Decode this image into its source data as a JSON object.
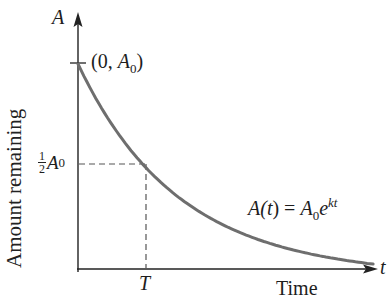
{
  "chart_data": {
    "type": "line",
    "title": "",
    "xlabel": "Time",
    "ylabel": "Amount remaining",
    "x_axis_symbol": "t",
    "y_axis_symbol": "A",
    "grid": false,
    "legend": null,
    "series": [
      {
        "name": "A(t) = A0 e^{kt}",
        "description": "exponential decay",
        "color": "#6e6e6e",
        "x": [
          0,
          0.5,
          1,
          1.5,
          2,
          2.5,
          3,
          3.5,
          4,
          4.34
        ],
        "y": [
          1,
          0.707,
          0.5,
          0.354,
          0.25,
          0.177,
          0.125,
          0.088,
          0.0625,
          0.049
        ]
      }
    ],
    "x_units": "multiples of half-life T",
    "y_units": "fraction of A0",
    "annotations": [
      {
        "text": "(0, A0)",
        "at": [
          0,
          1
        ]
      },
      {
        "text": "1/2 A0",
        "at": [
          0,
          0.5
        ],
        "kind": "y-tick"
      },
      {
        "text": "T",
        "at": [
          1,
          0
        ],
        "kind": "x-tick"
      },
      {
        "text": "A(t) = A0 e^kt",
        "kind": "curve-label"
      }
    ],
    "guides": [
      {
        "kind": "dashed",
        "from": [
          0,
          0.5
        ],
        "to": [
          1,
          0.5
        ]
      },
      {
        "kind": "dashed",
        "from": [
          1,
          0.5
        ],
        "to": [
          1,
          0
        ]
      }
    ]
  },
  "labels": {
    "y_axis_symbol": "A",
    "x_axis_symbol": "t",
    "ylabel": "Amount remaining",
    "xlabel": "Time",
    "initial_point": {
      "open": "(0, ",
      "A": "A",
      "sub": "0",
      "close": ")"
    },
    "half_tick": {
      "num": "1",
      "den": "2",
      "A": "A",
      "sub": "0"
    },
    "t_tick": "T",
    "formula": {
      "lhs": "A(",
      "t": "t",
      "rhs_open": ") = ",
      "A": "A",
      "sub": "0",
      "e": "e",
      "exp": "kt"
    }
  },
  "colors": {
    "curve": "#6e6e6e",
    "axis": "#222222",
    "dashed": "#555555"
  }
}
